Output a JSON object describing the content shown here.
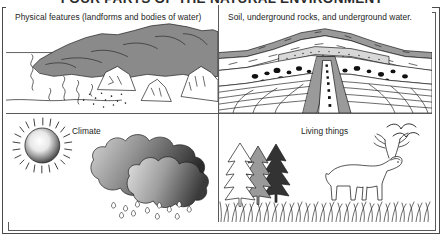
{
  "title": "FOUR PARTS OF THE NATURAL ENVIRONMENT",
  "panels": [
    {
      "id": "physical-features",
      "label": "Physical features (landforms and bodies of water)",
      "elements": [
        "mountain",
        "hills",
        "river",
        "horizon-line",
        "rock-outcrops"
      ]
    },
    {
      "id": "soil-and-underground",
      "label": "Soil, underground rocks, and underground water.",
      "elements": [
        "soil-layer",
        "rock-strata",
        "gravel-layer",
        "boulder-deposits",
        "underground-water-channel"
      ]
    },
    {
      "id": "climate",
      "label": "Climate",
      "elements": [
        "sun",
        "sun-rays",
        "storm-cloud",
        "rain-cloud",
        "raindrops"
      ]
    },
    {
      "id": "living-things",
      "label": "Living things",
      "elements": [
        "pine-tree-white",
        "pine-tree-gray",
        "pine-tree-dark",
        "deer",
        "grass",
        "birds"
      ]
    }
  ],
  "colors": {
    "ink": "#1c1c1c",
    "border": "#5a5a5a",
    "mountain_gray": "#8a8a8a",
    "cloud_dark": "#3a3a3a",
    "cloud_light": "#c9c9c9",
    "tree_gray": "#9a9a9a",
    "tree_dark": "#333333",
    "gravel": "#d8d8d8",
    "paper": "#ffffff"
  }
}
